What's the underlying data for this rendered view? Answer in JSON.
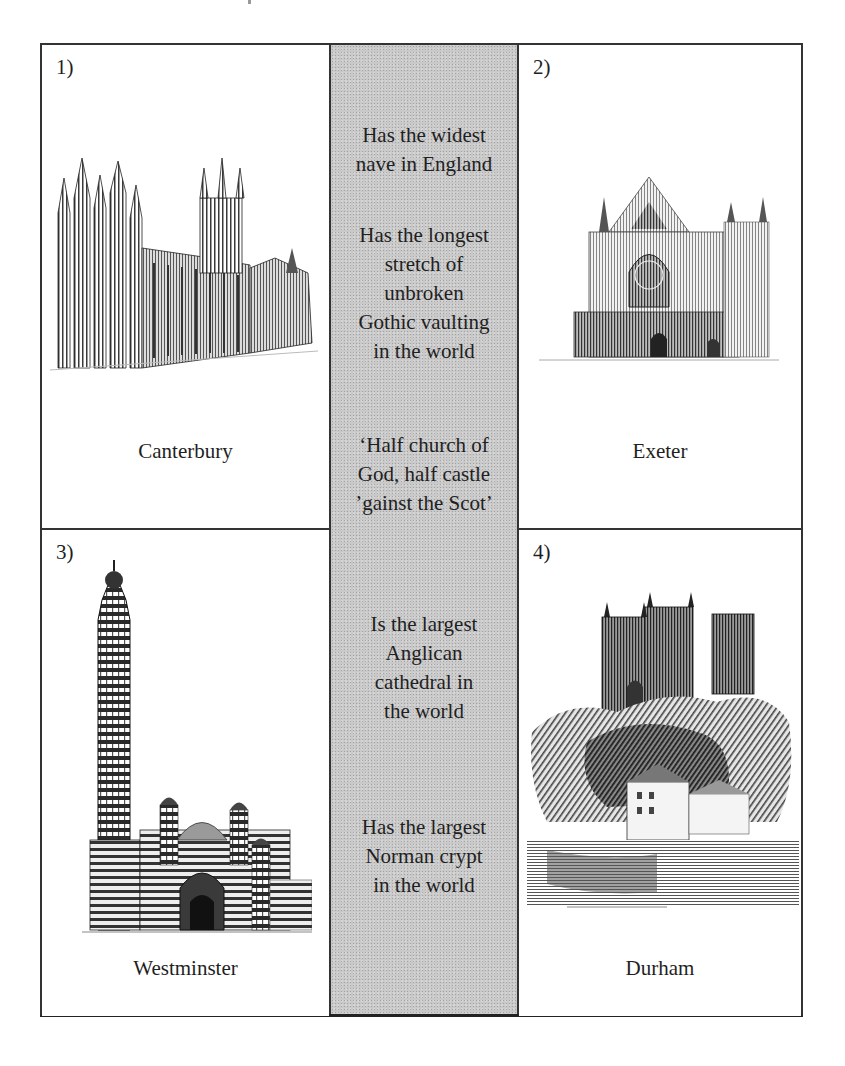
{
  "worksheet": {
    "middle_column": {
      "background_color": "#c9c9c9",
      "facts": [
        {
          "lines": [
            "Has the widest",
            "nave in England"
          ]
        },
        {
          "lines": [
            "Has the longest",
            "stretch of",
            "unbroken",
            "Gothic vaulting",
            "in the world"
          ]
        },
        {
          "lines": [
            "‘Half church of",
            "God, half castle",
            "’gainst the Scot’"
          ]
        },
        {
          "lines": [
            "Is the largest",
            "Anglican",
            "cathedral in",
            "the world"
          ]
        },
        {
          "lines": [
            "Has the largest",
            "Norman crypt",
            "in the world"
          ]
        }
      ]
    },
    "panels": [
      {
        "number": "1)",
        "name": "Canterbury",
        "illustration": "canterbury-cathedral-drawing"
      },
      {
        "number": "2)",
        "name": "Exeter",
        "illustration": "exeter-cathedral-drawing"
      },
      {
        "number": "3)",
        "name": "Westminster",
        "illustration": "westminster-cathedral-drawing"
      },
      {
        "number": "4)",
        "name": "Durham",
        "illustration": "durham-cathedral-drawing"
      }
    ]
  }
}
